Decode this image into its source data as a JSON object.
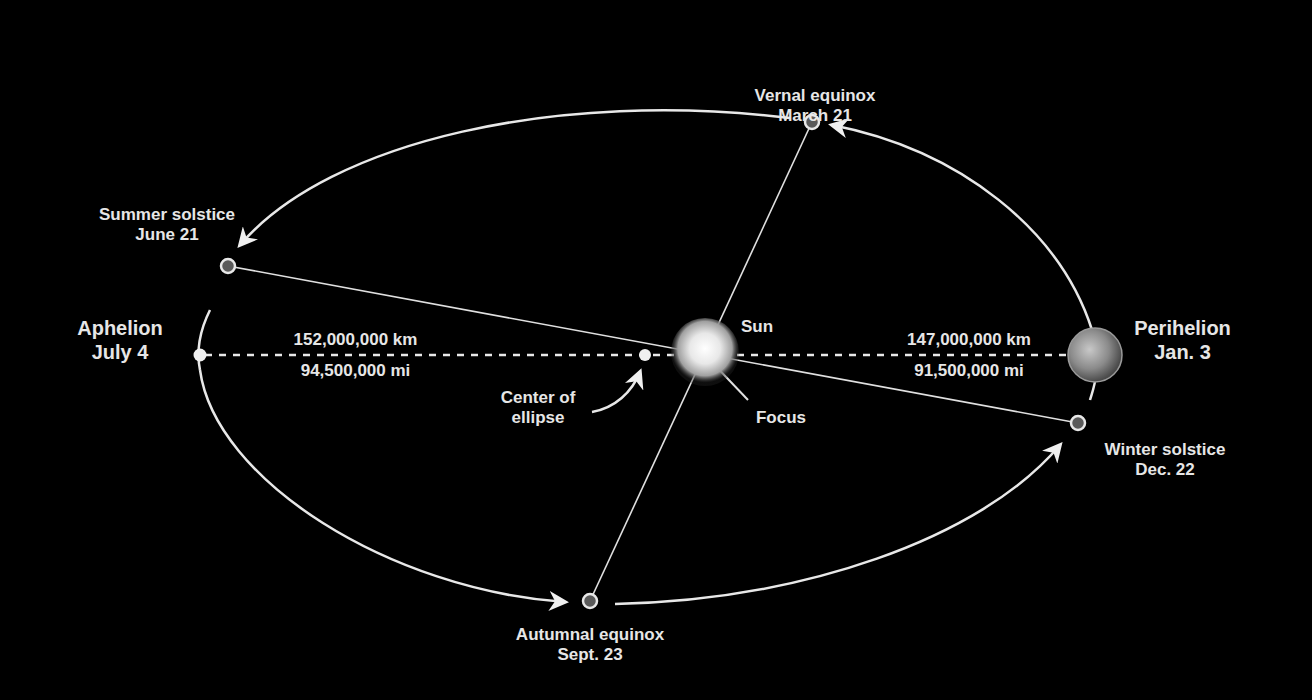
{
  "diagram": {
    "colors": {
      "background": "#000000",
      "line": "#e8e8e8",
      "text": "#e6e6e6",
      "marker_fill": "#555555"
    },
    "sun": {
      "label": "Sun",
      "focus_label": "Focus"
    },
    "center": {
      "label_line1": "Center of",
      "label_line2": "ellipse"
    },
    "aphelion": {
      "name": "Aphelion",
      "date": "July 4",
      "distance_km": "152,000,000 km",
      "distance_mi": "94,500,000 mi"
    },
    "perihelion": {
      "name": "Perihelion",
      "date": "Jan. 3",
      "distance_km": "147,000,000 km",
      "distance_mi": "91,500,000 mi"
    },
    "vernal": {
      "name": "Vernal equinox",
      "date": "March 21"
    },
    "summer": {
      "name": "Summer solstice",
      "date": "June 21"
    },
    "autumnal": {
      "name": "Autumnal equinox",
      "date": "Sept. 23"
    },
    "winter": {
      "name": "Winter solstice",
      "date": "Dec. 22"
    }
  }
}
